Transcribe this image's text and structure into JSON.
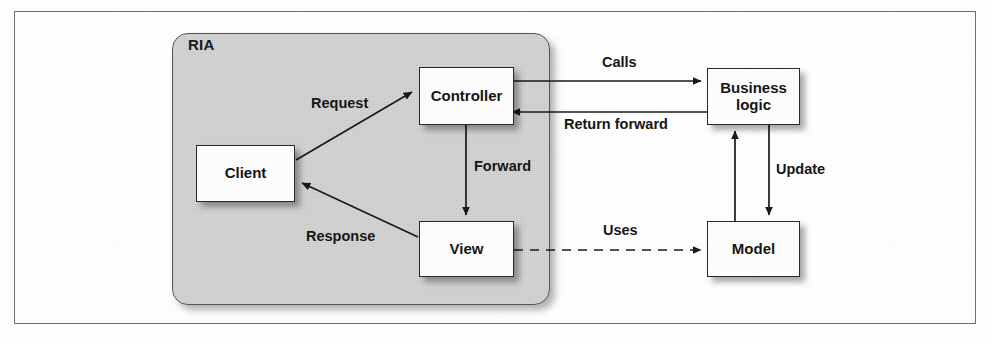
{
  "figure": {
    "container_label": "RIA",
    "frame_color": "#6e6e6e",
    "panel_fill": "#c8c8c8",
    "node_fill": "#fcfcfc",
    "line_color": "#1a1a1a"
  },
  "nodes": [
    {
      "id": "client",
      "label": "Client",
      "x": 196,
      "y": 145,
      "w": 99,
      "h": 57
    },
    {
      "id": "controller",
      "label": "Controller",
      "x": 419,
      "y": 67,
      "w": 95,
      "h": 58
    },
    {
      "id": "view",
      "label": "View",
      "x": 419,
      "y": 221,
      "w": 95,
      "h": 56
    },
    {
      "id": "business",
      "label": "Business\nlogic",
      "x": 707,
      "y": 68,
      "w": 93,
      "h": 57
    },
    {
      "id": "model",
      "label": "Model",
      "x": 707,
      "y": 221,
      "w": 93,
      "h": 56
    }
  ],
  "edges": [
    {
      "id": "request",
      "label": "Request",
      "from": "client",
      "to": "controller",
      "style": "solid",
      "label_x": 311,
      "label_y": 95
    },
    {
      "id": "response",
      "label": "Response",
      "from": "view",
      "to": "client",
      "style": "solid",
      "label_x": 306,
      "label_y": 228
    },
    {
      "id": "forward",
      "label": "Forward",
      "from": "controller",
      "to": "view",
      "style": "solid",
      "label_x": 474,
      "label_y": 158
    },
    {
      "id": "calls",
      "label": "Calls",
      "from": "controller",
      "to": "business",
      "style": "solid",
      "label_x": 602,
      "label_y": 54
    },
    {
      "id": "return-forward",
      "label": "Return forward",
      "from": "business",
      "to": "controller",
      "style": "solid",
      "label_x": 564,
      "label_y": 116
    },
    {
      "id": "update",
      "label": "Update",
      "from": "business",
      "to": "model",
      "style": "solid",
      "label_x": 776,
      "label_y": 161
    },
    {
      "id": "notify",
      "label": "",
      "from": "model",
      "to": "business",
      "style": "solid",
      "label_x": 0,
      "label_y": 0
    },
    {
      "id": "uses",
      "label": "Uses",
      "from": "view",
      "to": "model",
      "style": "dashed",
      "label_x": 603,
      "label_y": 222
    }
  ]
}
